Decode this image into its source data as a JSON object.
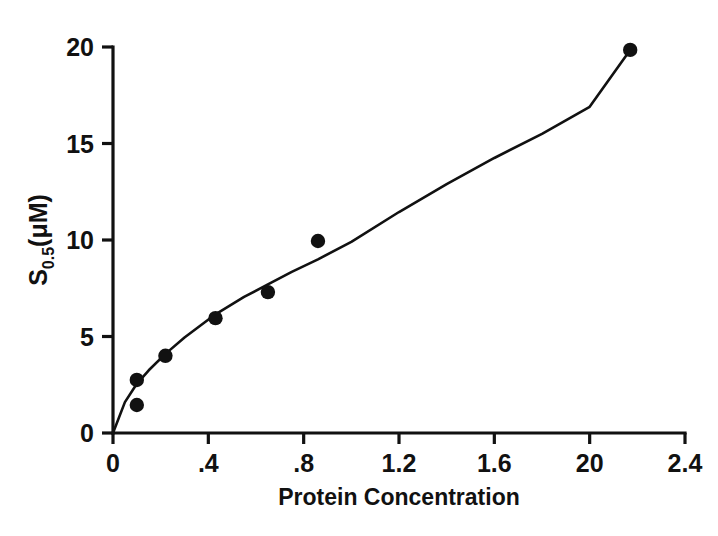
{
  "chart_data": {
    "type": "scatter",
    "title": "",
    "subtitle": "",
    "xlabel": "Protein Concentration",
    "ylabel": "S0.5(μM)",
    "ylabel_parts": {
      "symbol": "S",
      "subscript": "0.5",
      "units": "(μM)"
    },
    "xlim": [
      0,
      2.4
    ],
    "ylim": [
      0,
      20
    ],
    "xticks": [
      0,
      0.4,
      0.8,
      1.2,
      1.6,
      2.0,
      2.4
    ],
    "xtick_labels": [
      "0",
      ".4",
      ".8",
      "1.2",
      "1.6",
      "20",
      "2.4"
    ],
    "yticks": [
      0,
      5,
      10,
      15,
      20
    ],
    "ytick_labels": [
      "0",
      "5",
      "10",
      "15",
      "20"
    ],
    "grid": false,
    "legend": null,
    "legend_position": "none",
    "axis_style": "left-and-bottom-spines",
    "marker": "filled-circle",
    "marker_color": "#111111",
    "line_color": "#111111",
    "background_color": "#ffffff",
    "points": [
      {
        "x": 0.1,
        "y": 1.45
      },
      {
        "x": 0.1,
        "y": 2.75
      },
      {
        "x": 0.22,
        "y": 4.0
      },
      {
        "x": 0.43,
        "y": 5.95
      },
      {
        "x": 0.65,
        "y": 7.3
      },
      {
        "x": 0.86,
        "y": 9.95
      },
      {
        "x": 2.17,
        "y": 19.85
      }
    ],
    "fitted_curve": {
      "description": "smooth saturating curve through origin",
      "x": [
        0.0,
        0.05,
        0.1,
        0.15,
        0.22,
        0.3,
        0.43,
        0.55,
        0.65,
        0.75,
        0.86,
        1.0,
        1.2,
        1.4,
        1.6,
        1.8,
        2.0,
        2.17
      ],
      "y": [
        0.0,
        1.6,
        2.55,
        3.25,
        4.1,
        4.95,
        6.15,
        7.05,
        7.7,
        8.35,
        9.0,
        9.9,
        11.45,
        12.9,
        14.25,
        15.5,
        16.9,
        19.85
      ]
    }
  },
  "figure": {
    "xaxis_caption": "Protein Concentration"
  }
}
